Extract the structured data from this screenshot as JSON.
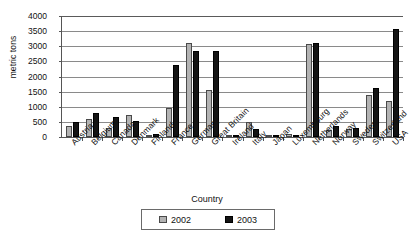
{
  "chart_data": {
    "type": "bar",
    "title": "",
    "xlabel": "Country",
    "ylabel": "metric tons",
    "ylim": [
      0,
      4000
    ],
    "ytick_values": [
      4000,
      3500,
      3000,
      2500,
      2000,
      1500,
      1000,
      500,
      0
    ],
    "grid": true,
    "legend_position": "bottom",
    "categories": [
      "Austria",
      "Belgium",
      "Canada",
      "Denmark",
      "Finland",
      "France",
      "Germany",
      "Great Britain",
      "Ireland",
      "Italy",
      "Japan",
      "Luxembourg",
      "Netherlands",
      "Norway",
      "Sweden",
      "Switzerland",
      "USA"
    ],
    "series": [
      {
        "name": "2002",
        "color": "#b3b3b3",
        "values": [
          350,
          580,
          300,
          720,
          70,
          970,
          3120,
          1550,
          40,
          490,
          20,
          90,
          3080,
          230,
          250,
          1400,
          1180
        ]
      },
      {
        "name": "2003",
        "color": "#141414",
        "values": [
          500,
          800,
          660,
          540,
          110,
          2370,
          2840,
          2860,
          60,
          270,
          10,
          70,
          3120,
          370,
          290,
          1620,
          3580
        ]
      }
    ]
  },
  "legend": {
    "entries": [
      {
        "label": "2002",
        "swatch": "legend-swatch-2002"
      },
      {
        "label": "2003",
        "swatch": "legend-swatch-2003"
      }
    ]
  }
}
